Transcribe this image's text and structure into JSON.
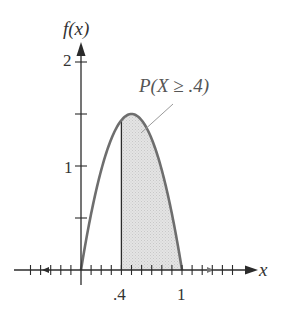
{
  "chart_data": {
    "type": "area",
    "title": "",
    "xlabel": "x",
    "ylabel": "f(x)",
    "function": "f(x) = 6x(1 - x), 0 <= x <= 1",
    "x": [
      0,
      0.1,
      0.2,
      0.3,
      0.4,
      0.5,
      0.6,
      0.7,
      0.8,
      0.9,
      1.0
    ],
    "series": [
      {
        "name": "f(x)",
        "values": [
          0,
          0.54,
          0.96,
          1.26,
          1.44,
          1.5,
          1.44,
          1.26,
          0.96,
          0.54,
          0
        ]
      }
    ],
    "shaded_region": {
      "from": 0.4,
      "to": 1.0,
      "label": "P(X ≥ .4)"
    },
    "xlim": [
      -0.5,
      1.7
    ],
    "ylim": [
      0,
      2.1
    ],
    "x_tick_labels": [
      ".4",
      "1"
    ],
    "y_tick_labels": [
      "1",
      "2"
    ],
    "x_minor_tick_step": 0.1,
    "y_minor_tick_step": 0.5,
    "annotations": [
      "P(X ≥ .4)"
    ],
    "grid": false,
    "legend": null
  },
  "labels": {
    "y_axis": "f(x)",
    "x_axis": "x",
    "y_tick_2": "2",
    "y_tick_1": "1",
    "x_tick_04": ".4",
    "x_tick_1": "1",
    "annotation": "P(X ≥ .4)"
  },
  "colors": {
    "curve": "#6e6e6e",
    "axis": "#2b2b2b",
    "fill": "#dcdcdc",
    "text": "#333333"
  }
}
